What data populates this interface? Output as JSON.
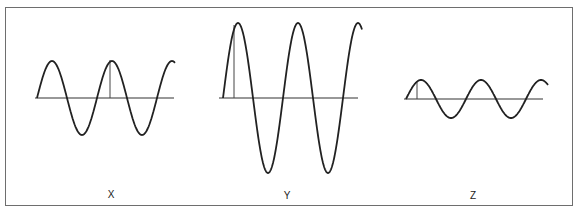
{
  "diagram": {
    "type": "wave-comparison",
    "waves": [
      {
        "label": "X",
        "amplitude": "medium",
        "cycles": 2.25,
        "axis_y": 98,
        "x_start": 37,
        "x_end": 175,
        "amplitude_px": 37,
        "period_px": 60,
        "marker_x": 110
      },
      {
        "label": "Y",
        "amplitude": "large",
        "cycles": 2.25,
        "axis_y": 98,
        "x_start": 223,
        "x_end": 362,
        "amplitude_px": 75,
        "period_px": 60,
        "marker_x": 234
      },
      {
        "label": "Z",
        "amplitude": "small",
        "cycles": 2.25,
        "axis_y": 98,
        "x_start": 406,
        "x_end": 548,
        "amplitude_px": 19,
        "period_px": 60,
        "marker_x": 417
      }
    ],
    "colors": {
      "stroke": "#222222",
      "border": "#6e6e6e",
      "background": "#ffffff"
    }
  },
  "labels": {
    "x": "X",
    "y": "Y",
    "z": "Z"
  }
}
